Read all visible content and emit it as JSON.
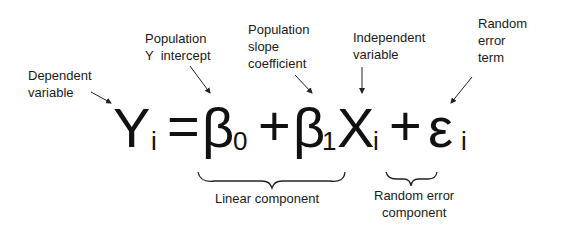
{
  "diagram": {
    "equation": {
      "lhs": {
        "symbol": "Y",
        "subscript": "i"
      },
      "equals": "=",
      "intercept": {
        "symbol": "β",
        "subscript": "0"
      },
      "plus1": "+",
      "slope": {
        "symbol": "β",
        "subscript": "1"
      },
      "x_var": {
        "symbol": "X",
        "subscript": "i"
      },
      "plus2": "+",
      "error": {
        "symbol": "ε",
        "subscript": "i"
      }
    },
    "annotations": {
      "dependent": {
        "line1": "Dependent",
        "line2": "variable"
      },
      "intercept": {
        "line1": "Population",
        "line2": "Y  intercept"
      },
      "slope": {
        "line1": "Population",
        "line2": "slope",
        "line3": "coefficient"
      },
      "independent": {
        "line1": "Independent",
        "line2": "variable"
      },
      "error_term": {
        "line1": "Random",
        "line2": "error",
        "line3": "term"
      }
    },
    "braces": {
      "linear": {
        "label": "Linear component"
      },
      "random": {
        "line1": "Random error",
        "line2": "component"
      }
    },
    "colors": {
      "text": "#1a1a1a",
      "background": "#ffffff"
    }
  }
}
